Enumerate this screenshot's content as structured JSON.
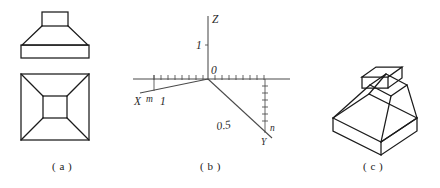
{
  "figure": {
    "background_color": "#ffffff",
    "line_color": "#1b1b1b",
    "axis_color": "#4a4a4a"
  },
  "panels": [
    {
      "id": "a",
      "caption": "( a )",
      "description": "Orthographic projection: front elevation above, top plan view below",
      "views": {
        "front": "trapezoid frustum with small rectangular boss on top and rectangular base slab",
        "top": "square outline with diagonals converging to a centered inner square"
      }
    },
    {
      "id": "b",
      "caption": "( b )",
      "description": "Three-dimensional coordinate axis system with tick marks",
      "axes": [
        {
          "name": "Z",
          "label": "Z",
          "direction": "vertical-up"
        },
        {
          "name": "X",
          "label": "X",
          "direction": "lower-left-oblique"
        },
        {
          "name": "Y",
          "label": "Y",
          "direction": "lower-right-oblique"
        }
      ],
      "labels": {
        "origin": "0",
        "z_unit": "1",
        "x_unit": "1",
        "x_marker": "m",
        "y_value": "0.5",
        "y_marker": "n"
      }
    },
    {
      "id": "c",
      "caption": "( c )",
      "description": "Isometric pictorial view of the truncated pyramid with base slab and top boss"
    }
  ]
}
